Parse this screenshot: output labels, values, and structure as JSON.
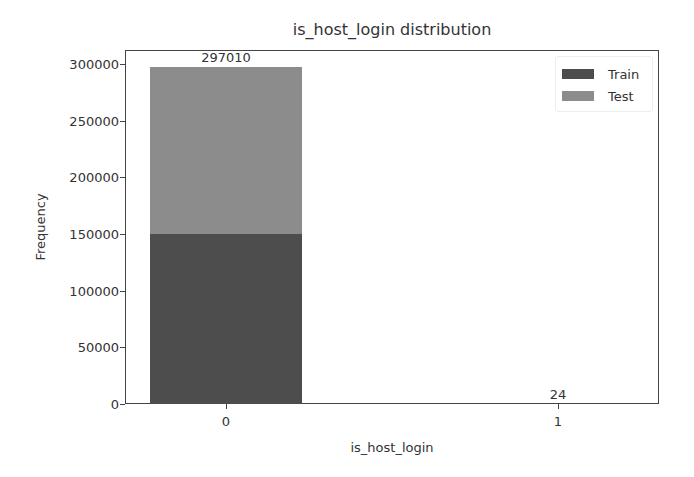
{
  "chart_data": {
    "type": "bar",
    "stacked": true,
    "title": "is_host_login distribution",
    "xlabel": "is_host_login",
    "ylabel": "Frequency",
    "categories": [
      "0",
      "1"
    ],
    "series": [
      {
        "name": "Train",
        "values": [
          150000,
          12
        ],
        "color": "#4d4d4d"
      },
      {
        "name": "Test",
        "values": [
          147010,
          12
        ],
        "color": "#8c8c8c"
      }
    ],
    "totals": [
      297010,
      24
    ],
    "bar_labels": [
      "297010",
      "24"
    ],
    "ylim": [
      0,
      312000
    ],
    "yticks": [
      0,
      50000,
      100000,
      150000,
      200000,
      250000,
      300000
    ],
    "ytick_labels": [
      "0",
      "50000",
      "100000",
      "150000",
      "200000",
      "250000",
      "300000"
    ],
    "grid": false,
    "legend_position": "upper right"
  },
  "legend": {
    "items": [
      {
        "label": "Train",
        "color": "#4d4d4d"
      },
      {
        "label": "Test",
        "color": "#8c8c8c"
      }
    ]
  }
}
